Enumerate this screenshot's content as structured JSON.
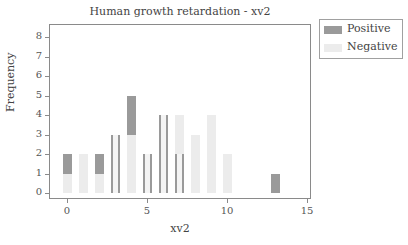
{
  "chart_data": {
    "type": "bar",
    "title": "Human growth retardation - xv2",
    "xlabel": "xv2",
    "ylabel": "Frequency",
    "xlim": [
      -1,
      15.4
    ],
    "ylim": [
      -0.3,
      8.5
    ],
    "xticks": [
      0,
      5,
      10,
      15
    ],
    "yticks": [
      0,
      1,
      2,
      3,
      4,
      5,
      6,
      7,
      8
    ],
    "grid": false,
    "legend_position": "top-right outside",
    "stacked": true,
    "series": [
      {
        "name": "Positive",
        "color": "#9a9a9a",
        "points": [
          {
            "x": 0,
            "value": 1
          },
          {
            "x": 2,
            "value": 1
          },
          {
            "x": 4,
            "value": 2
          },
          {
            "x": 13,
            "value": 1
          }
        ]
      },
      {
        "name": "Negative",
        "color": "#ececec",
        "points": [
          {
            "x": 0,
            "value": 1
          },
          {
            "x": 1,
            "value": 2
          },
          {
            "x": 2,
            "value": 1
          },
          {
            "x": 4,
            "value": 3
          },
          {
            "x": 7,
            "value": 4
          },
          {
            "x": 8,
            "value": 3
          },
          {
            "x": 9,
            "value": 4
          },
          {
            "x": 10,
            "value": 2
          }
        ]
      }
    ],
    "outlined_bars": [
      {
        "x": 3,
        "value": 3
      },
      {
        "x": 5,
        "value": 2
      },
      {
        "x": 6,
        "value": 4
      },
      {
        "x": 7,
        "value": 2
      }
    ]
  },
  "legend": {
    "items": [
      {
        "label": "Positive",
        "color": "#9a9a9a"
      },
      {
        "label": "Negative",
        "color": "#ececec"
      }
    ]
  },
  "axis": {
    "y_ticks": [
      "0",
      "1",
      "2",
      "3",
      "4",
      "5",
      "6",
      "7",
      "8"
    ],
    "x_ticks": [
      "0",
      "5",
      "10",
      "15"
    ]
  }
}
